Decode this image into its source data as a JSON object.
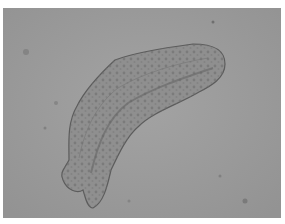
{
  "image": {
    "kind": "micrograph",
    "description": "Grayscale light-microscopy image of an elongated, curved, granular larva-like organism on a plain gray background",
    "colors": {
      "border": "#ffffff",
      "background": "#9c9c9c",
      "organism_fill": "#8e8e8e",
      "organism_outline": "#5a5a5a",
      "granules": "#6a6a6a"
    }
  }
}
